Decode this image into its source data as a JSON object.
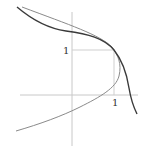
{
  "diagram": {
    "labels": {
      "y_unit": "1",
      "x_unit": "1"
    },
    "colors": {
      "axes": "#c8c8c8",
      "guide": "#cfcfcf",
      "parabola": "#8a8a8a",
      "dark_curve": "#3a3a3a",
      "background": "#ffffff"
    },
    "curves": [
      {
        "name": "parabola",
        "description": "sideways parabola opening left, vertex near (1.1, 0.4)"
      },
      {
        "name": "dark-curve",
        "description": "decreasing curve passing through (1,1), tangent to parabola"
      }
    ]
  }
}
